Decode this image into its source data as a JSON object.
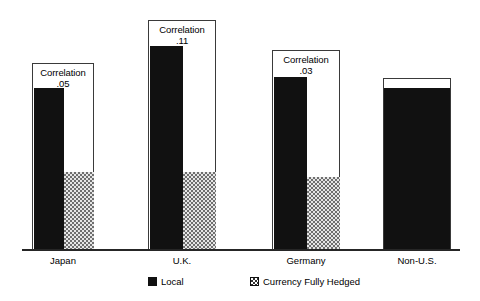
{
  "chart_data": {
    "type": "bar",
    "title": "",
    "subtitle": "",
    "xlabel": "",
    "ylabel": "",
    "grid": false,
    "legend_position": "bottom",
    "categories": [
      "Japan",
      "U.K.",
      "Germany",
      "Non-U.S."
    ],
    "series": [
      {
        "name": "Local",
        "color": "#111111",
        "values": [
          0.66,
          0.83,
          0.71,
          0.66
        ]
      },
      {
        "name": "Currency Fully Hedged",
        "color": "#e6e6e6",
        "values": [
          0.33,
          0.33,
          0.31,
          null
        ]
      }
    ],
    "annotations": [
      {
        "category": "Japan",
        "label": "Correlation",
        "value": ".05"
      },
      {
        "category": "U.K.",
        "label": "Correlation",
        "value": ".11"
      },
      {
        "category": "Germany",
        "label": "Correlation",
        "value": ".03"
      }
    ]
  },
  "legend": {
    "items": [
      {
        "label": "Local",
        "swatch": "solid-black-swatch"
      },
      {
        "label": "Currency Fully Hedged",
        "swatch": "stippled-swatch"
      }
    ]
  },
  "groups": [
    {
      "key": "japan",
      "category": "Japan",
      "correlation_word": "Correlation",
      "correlation_value": ".05",
      "frame": {
        "left": 32,
        "top": 63,
        "width": 62,
        "height": 187
      },
      "local_bar": {
        "left": 1,
        "width": 30,
        "height": 161
      },
      "hedged_bar": {
        "left": 31,
        "width": 30,
        "height": 77
      },
      "label_left": 32,
      "label_width": 62
    },
    {
      "key": "uk",
      "category": "U.K.",
      "correlation_word": "Correlation",
      "correlation_value": ".11",
      "frame": {
        "left": 148,
        "top": 20,
        "width": 68,
        "height": 230
      },
      "local_bar": {
        "left": 1,
        "width": 33,
        "height": 203
      },
      "hedged_bar": {
        "left": 34,
        "width": 33,
        "height": 77
      },
      "label_left": 148,
      "label_width": 68
    },
    {
      "key": "germany",
      "category": "Germany",
      "correlation_word": "Correlation",
      "correlation_value": ".03",
      "frame": {
        "left": 272,
        "top": 50,
        "width": 68,
        "height": 200
      },
      "local_bar": {
        "left": 1,
        "width": 33,
        "height": 172
      },
      "hedged_bar": {
        "left": 34,
        "width": 33,
        "height": 72
      },
      "label_left": 272,
      "label_width": 68
    }
  ],
  "solid_group": {
    "key": "non-us",
    "category": "Non-U.S.",
    "frame": {
      "left": 383,
      "top": 78,
      "width": 68,
      "height": 172
    },
    "bar_height": 161,
    "label_left": 383,
    "label_width": 68
  }
}
